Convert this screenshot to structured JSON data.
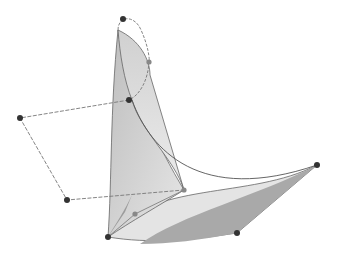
{
  "diagram": {
    "type": "bezier-surface-with-control-polygon",
    "background": "#ffffff",
    "colors": {
      "surface_light": "#e2e2e2",
      "surface_mid": "#c4c4c4",
      "surface_dark": "#a8a8a8",
      "edge": "#555555",
      "control_polygon": "#777777",
      "control_point": "#333333",
      "control_point_light": "#888888"
    },
    "control_points": [
      {
        "id": "p0",
        "x": 123,
        "y": 19,
        "tone": "dark"
      },
      {
        "id": "p1",
        "x": 149,
        "y": 62,
        "tone": "light"
      },
      {
        "id": "p2",
        "x": 129,
        "y": 100,
        "tone": "dark"
      },
      {
        "id": "p3",
        "x": 20,
        "y": 118,
        "tone": "dark"
      },
      {
        "id": "p4",
        "x": 67,
        "y": 200,
        "tone": "dark"
      },
      {
        "id": "p5",
        "x": 108,
        "y": 237,
        "tone": "dark"
      },
      {
        "id": "p6",
        "x": 135,
        "y": 214,
        "tone": "light"
      },
      {
        "id": "p7",
        "x": 184,
        "y": 190,
        "tone": "light"
      },
      {
        "id": "p8",
        "x": 317,
        "y": 165,
        "tone": "dark"
      },
      {
        "id": "p9",
        "x": 237,
        "y": 233,
        "tone": "dark"
      }
    ]
  }
}
